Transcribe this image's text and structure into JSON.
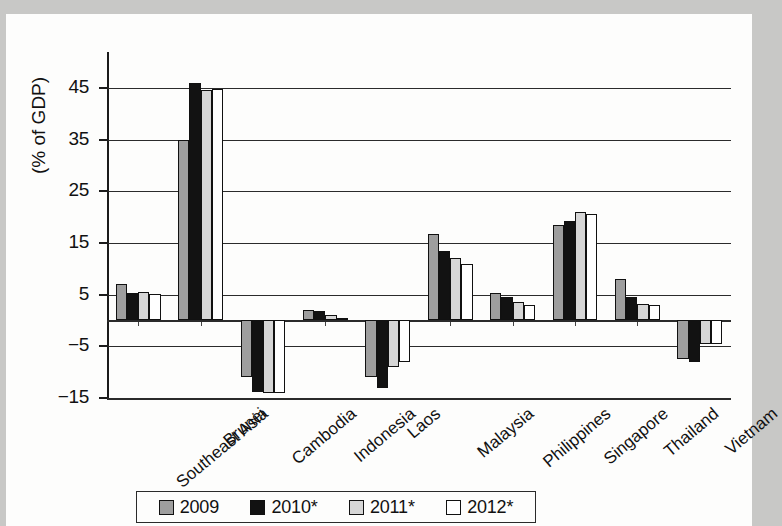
{
  "chart_data": {
    "type": "bar",
    "title": "",
    "xlabel": "",
    "ylabel": "(% of GDP)",
    "ylim": [
      -15,
      50
    ],
    "yticks": [
      45,
      35,
      25,
      15,
      5,
      -5,
      -15
    ],
    "ytick_labels": [
      "45",
      "35",
      "25",
      "15",
      "5",
      "−5",
      "−15"
    ],
    "grid": true,
    "legend_position": "bottom",
    "categories": [
      "Southeast Asia",
      "Brunei",
      "Cambodia",
      "Indonesia",
      "Laos",
      "Malaysia",
      "Philippines",
      "Singapore",
      "Thailand",
      "Vietnam"
    ],
    "series": [
      {
        "name": "2009",
        "color": "#9e9e9e",
        "values": [
          7.0,
          35.0,
          -11.0,
          2.0,
          -11.0,
          16.8,
          5.4,
          18.5,
          8.0,
          -7.5
        ]
      },
      {
        "name": "2010*",
        "color": "#121212",
        "values": [
          5.3,
          46.0,
          -13.8,
          1.8,
          -13.0,
          13.5,
          4.5,
          19.2,
          4.5,
          -8.0
        ]
      },
      {
        "name": "2011*",
        "color": "#d6d6d6",
        "values": [
          5.5,
          44.5,
          -14.0,
          1.0,
          -9.0,
          12.0,
          3.6,
          21.0,
          3.2,
          -4.5
        ]
      },
      {
        "name": "2012*",
        "color": "#ffffff",
        "values": [
          5.2,
          44.8,
          -14.0,
          0.5,
          -8.0,
          11.0,
          3.0,
          20.5,
          3.0,
          -4.5
        ]
      }
    ]
  },
  "legend": {
    "items": [
      {
        "label": "2009",
        "swatch": "swatch-2009-gray"
      },
      {
        "label": "2010*",
        "swatch": "swatch-2010-black"
      },
      {
        "label": "2011*",
        "swatch": "swatch-2011-lightgray"
      },
      {
        "label": "2012*",
        "swatch": "swatch-2012-white"
      }
    ]
  }
}
